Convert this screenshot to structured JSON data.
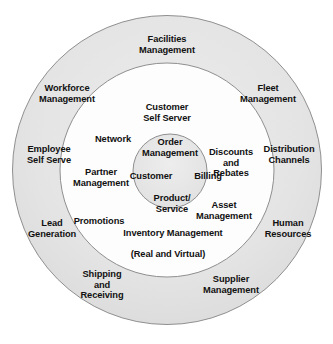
{
  "diagram": {
    "type": "concentric-circles",
    "title": "",
    "colors": {
      "outer_ring_fill": "#e3e3e3",
      "middle_ring_fill": "#ffffff",
      "inner_circle_fill": "#e3e3e3",
      "stroke": "#8c8c8c",
      "text": "#111111"
    },
    "geometry": {
      "center_x": 167,
      "center_y": 170,
      "outer_radius": 155,
      "middle_radius": 107,
      "inner_radius": 37
    },
    "rings": [
      {
        "name": "outer-ring",
        "labels": [
          {
            "id": "facilities-management",
            "text": "Facilities\nManagement",
            "x": 167,
            "y": 45
          },
          {
            "id": "workforce-management",
            "text": "Workforce\nManagement",
            "x": 67,
            "y": 94
          },
          {
            "id": "fleet-management",
            "text": "Fleet\nManagement",
            "x": 268,
            "y": 94
          },
          {
            "id": "employee-self-serve",
            "text": "Employee\nSelf Serve",
            "x": 49,
            "y": 155
          },
          {
            "id": "distribution-channels",
            "text": "Distribution\nChannels",
            "x": 289,
            "y": 155
          },
          {
            "id": "lead-generation",
            "text": "Lead\nGeneration",
            "x": 52,
            "y": 229
          },
          {
            "id": "human-resources",
            "text": "Human\nResources",
            "x": 288,
            "y": 229
          },
          {
            "id": "shipping-and-receiving",
            "text": "Shipping\nand\nReceiving",
            "x": 102,
            "y": 285
          },
          {
            "id": "supplier-management",
            "text": "Supplier\nManagement",
            "x": 231,
            "y": 285
          }
        ]
      },
      {
        "name": "middle-ring",
        "labels": [
          {
            "id": "customer-self-server",
            "text": "Customer\nSelf Server",
            "x": 167,
            "y": 113
          },
          {
            "id": "network",
            "text": "Network",
            "x": 113,
            "y": 139
          },
          {
            "id": "discounts-and-rebates",
            "text": "Discounts\nand\nRebates",
            "x": 231,
            "y": 163
          },
          {
            "id": "partner-management",
            "text": "Partner\nManagement",
            "x": 101,
            "y": 178
          },
          {
            "id": "asset-management",
            "text": "Asset\nManagement",
            "x": 224,
            "y": 211
          },
          {
            "id": "promotions",
            "text": "Promotions",
            "x": 99,
            "y": 221
          },
          {
            "id": "inventory-management",
            "text": "Inventory Management",
            "sub": "(Real and Virtual)",
            "x": 168,
            "y": 249
          }
        ]
      },
      {
        "name": "inner-circle",
        "labels": [
          {
            "id": "order-management",
            "text": "Order\nManagement",
            "x": 170,
            "y": 148
          },
          {
            "id": "customer",
            "text": "Customer",
            "x": 151,
            "y": 176
          },
          {
            "id": "billing",
            "text": "Billing",
            "x": 208,
            "y": 176
          },
          {
            "id": "product-service",
            "text": "Product/\nService",
            "x": 172,
            "y": 204
          }
        ]
      }
    ]
  }
}
